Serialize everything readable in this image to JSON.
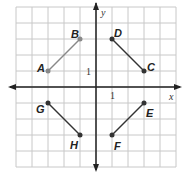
{
  "graph": {
    "x_axis_label": "x",
    "y_axis_label": "y",
    "x_tick_label": "1",
    "y_tick_label": "1",
    "grid_range": {
      "x": [
        -5,
        5
      ],
      "y": [
        -5,
        5
      ]
    },
    "colors": {
      "grid": "#c8c8c8",
      "axis": "#222222",
      "segment_ab": "#888888",
      "segment": "#333333"
    }
  },
  "points": [
    {
      "name": "A",
      "x": -3,
      "y": 1
    },
    {
      "name": "B",
      "x": -1,
      "y": 3
    },
    {
      "name": "C",
      "x": 3,
      "y": 1
    },
    {
      "name": "D",
      "x": 1,
      "y": 3
    },
    {
      "name": "E",
      "x": 3,
      "y": -1
    },
    {
      "name": "F",
      "x": 1,
      "y": -3
    },
    {
      "name": "G",
      "x": -3,
      "y": -1
    },
    {
      "name": "H",
      "x": -1,
      "y": -3
    }
  ],
  "segments": [
    [
      "A",
      "B"
    ],
    [
      "D",
      "C"
    ],
    [
      "G",
      "H"
    ],
    [
      "F",
      "E"
    ]
  ]
}
